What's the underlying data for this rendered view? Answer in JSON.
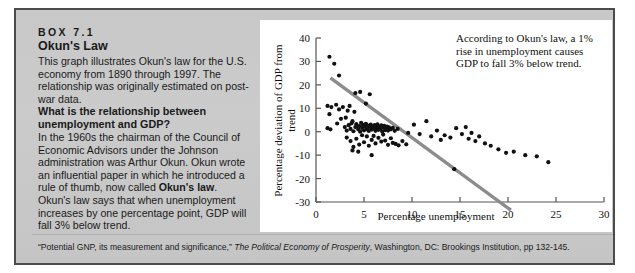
{
  "box": {
    "label": "BOX 7.1",
    "title": "Okun's Law",
    "para1": "This graph illustrates Okun's law for the U.S. economy from 1890 through 1997. The relationship was originally estimated on post-war data.",
    "question": "What is the relationship between unemployment and GDP?",
    "para2_a": "In the 1960s the chairman of the Council of Economic Advisors under the Johnson administration was Arthur Okun. Okun wrote an influential paper in which he introduced a rule of thumb, now called ",
    "para2_bold": "Okun's law",
    "para2_b": ". Okun's law says that when unemployment increases by one percentage point, GDP will fall 3% below trend."
  },
  "footnote": {
    "quote": "“Potential GNP, its measurement and significance,” ",
    "italic": "The Political Economy of Prosperity",
    "rest": ", Washington, DC: Brookings Institution, pp 132-145."
  },
  "chart_data": {
    "type": "scatter",
    "title": "",
    "xlabel": "Percentage unemployment",
    "ylabel": "Percentage deviation of GDP from trend",
    "xlim": [
      0,
      30
    ],
    "ylim": [
      -30,
      40
    ],
    "xticks": [
      0,
      5,
      10,
      15,
      20,
      25,
      30
    ],
    "yticks": [
      -30,
      -20,
      -10,
      0,
      10,
      20,
      30,
      40
    ],
    "grid": false,
    "legend": null,
    "annotation": "According to Okun's law, a 1% rise in unemployment causes GDP to fall 3% below trend.",
    "colors": {
      "point": "#111111",
      "trendline": "#8c8c8c",
      "axis": "#555555",
      "panel": "#ffffff",
      "box_background": "#c9c9c9",
      "box_border": "#4b4b4b"
    },
    "trendline": {
      "label": "Okun's law fit",
      "slope": -3.0,
      "intercept": 27.5,
      "x_start": 1.5,
      "y_start": 23.0,
      "x_end": 20.3,
      "y_end": -33.5
    },
    "points": [
      [
        1.4,
        32
      ],
      [
        1.9,
        29
      ],
      [
        2.4,
        24
      ],
      [
        1.2,
        11
      ],
      [
        1.6,
        10.5
      ],
      [
        1.4,
        7.5
      ],
      [
        2.1,
        11.5
      ],
      [
        2.4,
        9.5
      ],
      [
        2.6,
        5.5
      ],
      [
        2.2,
        3.5
      ],
      [
        1.2,
        1.5
      ],
      [
        1.5,
        1.0
      ],
      [
        2.8,
        10.5
      ],
      [
        3.1,
        6.0
      ],
      [
        3.3,
        9.0
      ],
      [
        3.5,
        11.0
      ],
      [
        3.8,
        4.5
      ],
      [
        4.0,
        8.5
      ],
      [
        4.3,
        2.5
      ],
      [
        4.1,
        16.5
      ],
      [
        4.6,
        17.0
      ],
      [
        5.2,
        12.0
      ],
      [
        5.6,
        16.0
      ],
      [
        3.0,
        2.0
      ],
      [
        3.2,
        0.5
      ],
      [
        3.4,
        2.8
      ],
      [
        3.6,
        1.2
      ],
      [
        3.7,
        3.6
      ],
      [
        3.9,
        0.2
      ],
      [
        4.1,
        2.0
      ],
      [
        4.2,
        3.2
      ],
      [
        4.4,
        1.0
      ],
      [
        4.5,
        2.4
      ],
      [
        4.6,
        0.0
      ],
      [
        4.7,
        3.8
      ],
      [
        4.8,
        1.6
      ],
      [
        4.9,
        2.9
      ],
      [
        5.0,
        0.6
      ],
      [
        5.1,
        2.2
      ],
      [
        5.2,
        3.4
      ],
      [
        5.3,
        1.1
      ],
      [
        5.4,
        2.6
      ],
      [
        5.5,
        0.3
      ],
      [
        5.6,
        1.9
      ],
      [
        5.7,
        3.0
      ],
      [
        5.8,
        0.9
      ],
      [
        5.9,
        2.3
      ],
      [
        6.0,
        1.4
      ],
      [
        6.1,
        2.8
      ],
      [
        6.2,
        0.4
      ],
      [
        6.3,
        1.8
      ],
      [
        6.4,
        3.1
      ],
      [
        6.5,
        0.8
      ],
      [
        6.6,
        2.1
      ],
      [
        6.7,
        1.3
      ],
      [
        6.8,
        2.7
      ],
      [
        6.9,
        0.1
      ],
      [
        7.0,
        1.7
      ],
      [
        7.1,
        2.5
      ],
      [
        7.2,
        0.7
      ],
      [
        7.3,
        1.5
      ],
      [
        7.4,
        2.2
      ],
      [
        7.5,
        0.5
      ],
      [
        7.6,
        1.9
      ],
      [
        7.8,
        1.0
      ],
      [
        8.0,
        1.6
      ],
      [
        8.2,
        0.4
      ],
      [
        8.5,
        1.2
      ],
      [
        3.2,
        -2.5
      ],
      [
        3.6,
        -4.0
      ],
      [
        3.9,
        -6.5
      ],
      [
        4.2,
        -3.0
      ],
      [
        4.5,
        -5.5
      ],
      [
        4.8,
        -1.5
      ],
      [
        5.0,
        -4.5
      ],
      [
        5.3,
        -2.0
      ],
      [
        5.5,
        -6.0
      ],
      [
        5.8,
        -3.5
      ],
      [
        6.0,
        -1.8
      ],
      [
        6.2,
        -5.0
      ],
      [
        6.5,
        -2.6
      ],
      [
        6.8,
        -4.2
      ],
      [
        7.0,
        -1.2
      ],
      [
        7.2,
        -3.8
      ],
      [
        7.5,
        -5.6
      ],
      [
        7.8,
        -2.8
      ],
      [
        8.0,
        -4.8
      ],
      [
        8.3,
        -5.2
      ],
      [
        8.6,
        -5.8
      ],
      [
        9.0,
        -4.0
      ],
      [
        9.4,
        -5.4
      ],
      [
        3.8,
        -8.0
      ],
      [
        4.4,
        -8.5
      ],
      [
        5.8,
        -10.0
      ],
      [
        9.6,
        -0.5
      ],
      [
        10.2,
        3.0
      ],
      [
        10.8,
        -1.0
      ],
      [
        11.5,
        4.5
      ],
      [
        12.0,
        -2.0
      ],
      [
        12.6,
        0.5
      ],
      [
        13.0,
        -3.5
      ],
      [
        13.4,
        -1.5
      ],
      [
        14.0,
        -2.5
      ],
      [
        14.6,
        1.5
      ],
      [
        15.2,
        -1.0
      ],
      [
        15.6,
        2.0
      ],
      [
        15.9,
        -3.0
      ],
      [
        16.2,
        -0.5
      ],
      [
        16.6,
        -4.0
      ],
      [
        17.0,
        -2.0
      ],
      [
        17.6,
        -5.0
      ],
      [
        18.2,
        -6.0
      ],
      [
        19.0,
        -7.5
      ],
      [
        19.8,
        -9.0
      ],
      [
        20.6,
        -8.5
      ],
      [
        21.8,
        -10.0
      ],
      [
        23.0,
        -10.5
      ],
      [
        24.2,
        -13.0
      ],
      [
        14.4,
        -16.0
      ]
    ]
  }
}
